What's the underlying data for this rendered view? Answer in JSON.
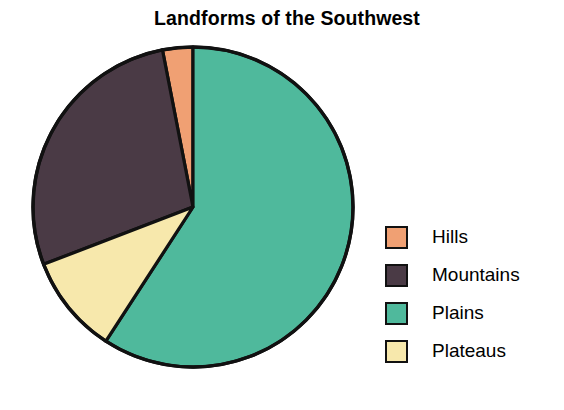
{
  "chart_data": {
    "type": "pie",
    "title": "Landforms of the Southwest",
    "xlabel": "",
    "ylabel": "",
    "legend_position": "right",
    "grid": false,
    "categories": [
      "Hills",
      "Mountains",
      "Plains",
      "Plateaus"
    ],
    "values": [
      3,
      17,
      59,
      21
    ],
    "slices": [
      {
        "label": "Hills",
        "value": 3,
        "color": "#F0A073",
        "start_angle_deg": 349,
        "end_angle_deg": 360
      },
      {
        "label": "Mountains",
        "value": 17,
        "color": "#4A3A45",
        "start_angle_deg": 249,
        "end_angle_deg": 349
      },
      {
        "label": "Plains",
        "value": 59,
        "color": "#4FB99C",
        "start_angle_deg": 0,
        "end_angle_deg": 213
      },
      {
        "label": "Plateaus",
        "value": 21,
        "color": "#F7E8AC",
        "start_angle_deg": 213,
        "end_angle_deg": 249
      }
    ]
  },
  "title": {
    "text": "Landforms of the Southwest"
  },
  "legend": {
    "items": [
      {
        "label": "Hills",
        "color": "#F0A073"
      },
      {
        "label": "Mountains",
        "color": "#4A3A45"
      },
      {
        "label": "Plains",
        "color": "#4FB99C"
      },
      {
        "label": "Plateaus",
        "color": "#F7E8AC"
      }
    ]
  },
  "colors": {
    "hills": "#F0A073",
    "mountains": "#4A3A45",
    "plains": "#4FB99C",
    "plateaus": "#F7E8AC",
    "outline": "#111111",
    "background": "#FFFFFF",
    "text": "#000000"
  },
  "geometry": {
    "center_x": 193,
    "center_y": 207,
    "radius": 160
  }
}
